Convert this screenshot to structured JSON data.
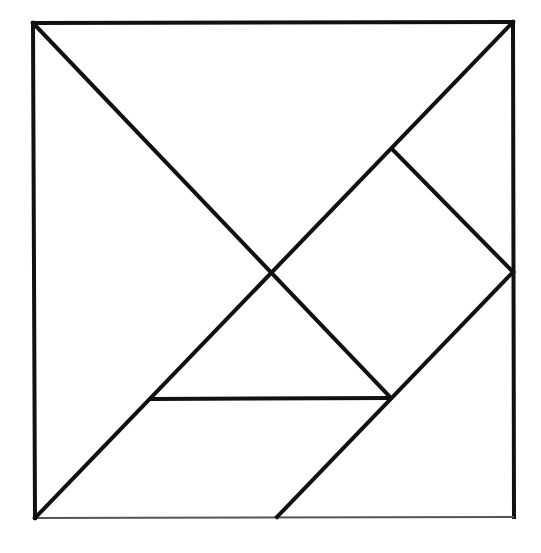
{
  "diagram": {
    "type": "tangram",
    "stroke_color": "#111111",
    "thin_stroke_color": "#555555",
    "background": "#ffffff",
    "points": {
      "TL": [
        33,
        23
      ],
      "TR": [
        513,
        22
      ],
      "BL": [
        35,
        518
      ],
      "BR": [
        514,
        517
      ],
      "C": [
        271,
        271
      ],
      "D": [
        392,
        149
      ],
      "R": [
        513,
        272
      ],
      "J": [
        390,
        397
      ],
      "P": [
        151,
        399
      ],
      "B": [
        277,
        517
      ]
    },
    "pieces": [
      {
        "name": "large-triangle-top",
        "vertices": [
          "TL",
          "TR",
          "C"
        ]
      },
      {
        "name": "large-triangle-left",
        "vertices": [
          "TL",
          "C",
          "BL"
        ]
      },
      {
        "name": "medium-triangle-top-right",
        "vertices": [
          "TR",
          "D",
          "R"
        ]
      },
      {
        "name": "square",
        "vertices": [
          "D",
          "R",
          "J",
          "C"
        ]
      },
      {
        "name": "small-triangle-center",
        "vertices": [
          "C",
          "J",
          "P"
        ]
      },
      {
        "name": "parallelogram-bottom",
        "vertices": [
          "BL",
          "P",
          "J",
          "B"
        ]
      },
      {
        "name": "triangle-bottom-right",
        "vertices": [
          "R",
          "BR",
          "B"
        ]
      }
    ]
  }
}
